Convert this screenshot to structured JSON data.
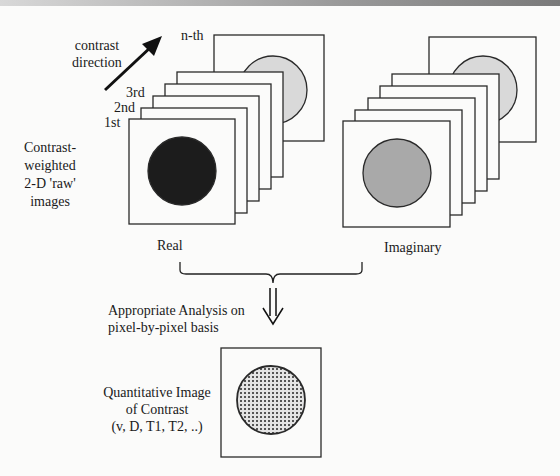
{
  "diagram": {
    "direction_label": [
      "contrast",
      "direction"
    ],
    "stack_labels": {
      "first": "1st",
      "second": "2nd",
      "third": "3rd",
      "nth": "n-th"
    },
    "raw_images_label": [
      "Contrast-",
      "weighted",
      "2-D 'raw'",
      "images"
    ],
    "real_label": "Real",
    "imaginary_label": "Imaginary",
    "analysis_label": [
      "Appropriate Analysis on",
      "pixel-by-pixel basis"
    ],
    "result_label": [
      "Quantitative Image",
      "of Contrast",
      "(v, D, T1, T2, ..)"
    ],
    "colors": {
      "real_disk": "#1c1c1c",
      "imaginary_disk": "#a9a9a9",
      "nth_disk": "#d9d9d9",
      "frame": "#2a2a2a",
      "background": "#fbfbfa"
    }
  }
}
